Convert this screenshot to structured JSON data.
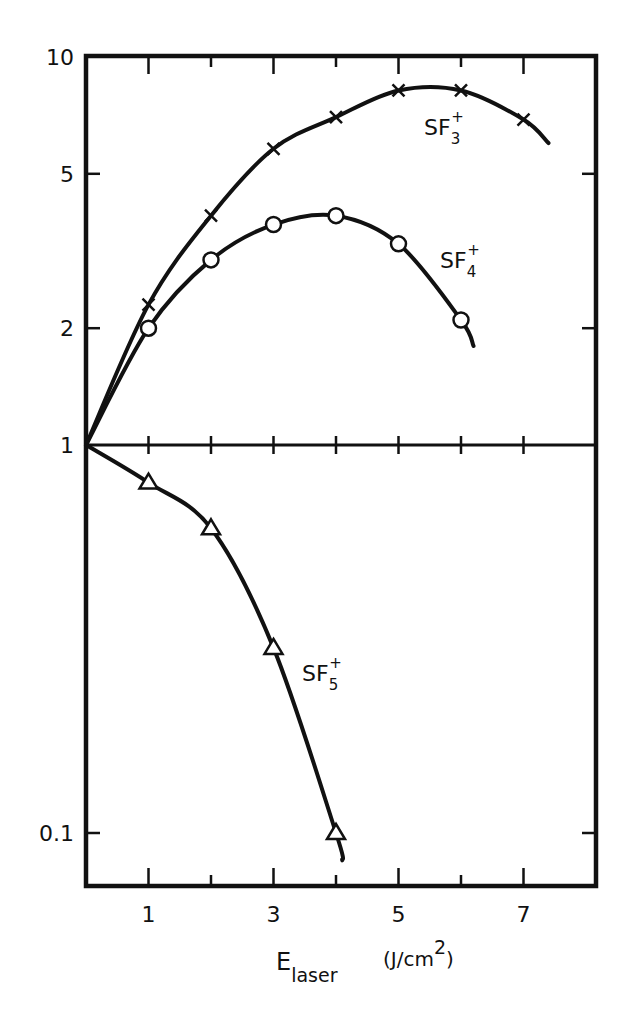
{
  "chart_data": {
    "type": "line",
    "title": "",
    "xlabel": "E_laser (J/cm^2)",
    "xlabel_main": "E",
    "xlabel_sub": "laser",
    "xlabel_unit_prefix": "(J/cm",
    "xlabel_unit_sup": "2",
    "xlabel_unit_suffix": ")",
    "ylabel": "",
    "yscale": "log",
    "xlim": [
      0,
      8
    ],
    "ylim": [
      0.07,
      10
    ],
    "grid": false,
    "legend": "inline labels",
    "x_ticks": [
      1,
      2,
      3,
      4,
      5,
      6,
      7
    ],
    "x_tick_labels": [
      "1",
      "3",
      "5",
      "7"
    ],
    "x_tick_label_values": [
      1,
      3,
      5,
      7
    ],
    "y_ticks": [
      10,
      5,
      2,
      1,
      0.1
    ],
    "y_tick_labels": [
      "10",
      "5",
      "2",
      "1",
      "0.1"
    ],
    "reference_line": {
      "y": 1,
      "style": "horizontal line across plot"
    },
    "series": [
      {
        "name": "SF3+",
        "label_main": "SF",
        "label_sub": "3",
        "label_sup": "+",
        "marker": "x",
        "x": [
          1,
          2,
          3,
          4,
          5,
          6,
          7
        ],
        "values": [
          2.3,
          3.9,
          5.8,
          7.0,
          8.2,
          8.2,
          6.9
        ],
        "curve_from": [
          0,
          1
        ],
        "curve_to": [
          7.4,
          6.0
        ]
      },
      {
        "name": "SF4+",
        "label_main": "SF",
        "label_sub": "4",
        "label_sup": "+",
        "marker": "circle",
        "x": [
          1,
          2,
          3,
          4,
          5,
          6
        ],
        "values": [
          2.0,
          3.0,
          3.7,
          3.9,
          3.3,
          2.1
        ],
        "curve_from": [
          0,
          1
        ],
        "curve_to": [
          6.2,
          1.8
        ]
      },
      {
        "name": "SF5+",
        "label_main": "SF",
        "label_sub": "5",
        "label_sup": "+",
        "marker": "triangle",
        "x": [
          1,
          2,
          3,
          4
        ],
        "values": [
          0.8,
          0.61,
          0.3,
          0.1
        ],
        "curve_from": [
          0,
          1
        ],
        "curve_to": [
          4.1,
          0.085
        ]
      }
    ]
  }
}
